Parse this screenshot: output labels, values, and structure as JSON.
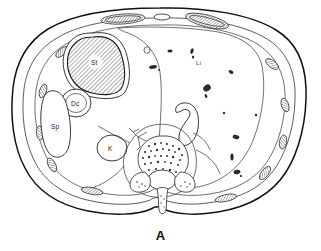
{
  "figure": {
    "caption": "A",
    "type": "anatomical-cross-section",
    "view": "axial abdominal section",
    "background_color": "#ffffff",
    "line_color": "#111111"
  },
  "labels": {
    "stomach": "St",
    "descending_colon": "Dc",
    "spleen": "Sp",
    "kidney": "K",
    "liver": "Li"
  },
  "structures": {
    "body_wall": "body-wall-outline",
    "stomach": "stomach",
    "descending_colon": "descending-colon",
    "spleen": "spleen",
    "kidney": "kidney",
    "liver": "liver",
    "vertebra": "vertebral-body",
    "spinal_canal": "spinal-canal",
    "spinous_process": "spinous-process",
    "transverse_process_left": "transverse-process-left",
    "transverse_process_right": "transverse-process-right",
    "aorta_branch": "celiac-artery-branch",
    "inferior_vena_cava": "inferior-vena-cava",
    "costal_cartilage_left": "costal-cartilage-left",
    "costal_cartilage_right": "costal-cartilage-right",
    "xiphoid": "xiphoid-process",
    "ribs": "rib-segments"
  },
  "colors": {
    "outline": "#111111",
    "inner_line": "#333333",
    "stomach_hatch": "#7a7a7a",
    "vessel": "#2b2b2b",
    "paper": "#ffffff"
  }
}
